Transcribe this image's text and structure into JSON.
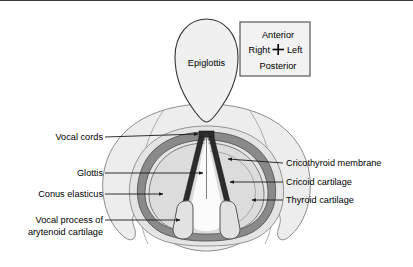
{
  "figure": {
    "background_color": "#ffffff",
    "border_color": "#3a3a3a"
  },
  "orientation_box": {
    "anterior": "Anterior",
    "right": "Right",
    "left": "Left",
    "posterior": "Posterior",
    "border_color": "#555555",
    "fill_color": "#f2f2f2"
  },
  "structures": {
    "epiglottis": {
      "label": "Epiglottis",
      "fill": "#f0f0f0",
      "stroke": "#333333"
    },
    "thyroid_cartilage": {
      "label": "Thyroid cartilage",
      "fill": "#ededed",
      "stroke": "#8c8c8c"
    },
    "cricothyroid_membrane": {
      "label": "Cricothyroid membrane",
      "fill": "#e4e4e4",
      "stroke": "#777777"
    },
    "cricoid_cartilage": {
      "label": "Cricoid cartilage",
      "fill": "#8a8a8a",
      "stroke": "#4a4a4a"
    },
    "conus_elasticus": {
      "label": "Conus elasticus",
      "fill": "#dcdcdc",
      "stroke": "#6a6a6a"
    },
    "vocal_cords": {
      "label": "Vocal cords",
      "fill": "#2b2b2b",
      "stroke": "#1a1a1a"
    },
    "glottis": {
      "label": "Glottis",
      "fill": "#fbfbfb",
      "stroke": "#555555"
    },
    "vocal_process": {
      "label_line1": "Vocal process of",
      "label_line2": "arytenoid cartilage",
      "fill": "#e2e2e2",
      "stroke": "#555555"
    }
  },
  "labels_left": [
    {
      "id": "vocal-cords",
      "text": "Vocal cords"
    },
    {
      "id": "glottis",
      "text": "Glottis"
    },
    {
      "id": "conus-elasticus",
      "text": "Conus elasticus"
    },
    {
      "id": "vocal-process-1",
      "text": "Vocal process of"
    },
    {
      "id": "vocal-process-2",
      "text": "arytenoid cartilage"
    }
  ],
  "labels_right": [
    {
      "id": "cricothyroid-membrane",
      "text": "Cricothyroid membrane"
    },
    {
      "id": "cricoid-cartilage",
      "text": "Cricoid cartilage"
    },
    {
      "id": "thyroid-cartilage",
      "text": "Thyroid cartilage"
    }
  ]
}
